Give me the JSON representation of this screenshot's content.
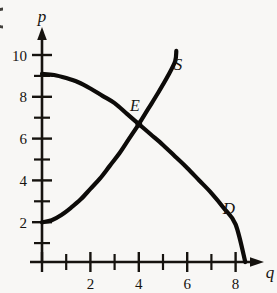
{
  "figure": {
    "background_color": "#f8f7f5",
    "ink_color": "#16130f",
    "edge_marker": "cropped-figure-bullet"
  },
  "axes": {
    "x": {
      "title": "q",
      "title_x": 268,
      "title_y": 272,
      "origin_px": 42,
      "unit_px": 24.2,
      "baseline_y": 262,
      "arrow_tip_x": 263,
      "major_ticks": [
        2,
        4,
        6,
        8
      ],
      "minor_ticks": [
        1,
        3,
        5,
        7
      ],
      "tick_labels": [
        "2",
        "4",
        "6",
        "8"
      ],
      "range": [
        0,
        9.1
      ]
    },
    "y": {
      "title": "p",
      "title_x": 42,
      "title_y": 16,
      "baseline_x": 42,
      "unit_px": 20.9,
      "arrow_tip_y": 30,
      "major_ticks": [
        2,
        4,
        6,
        8,
        10
      ],
      "minor_ticks": [
        1,
        3,
        5,
        7,
        9
      ],
      "tick_labels": [
        "2",
        "4",
        "6",
        "8",
        "10"
      ],
      "range": [
        0,
        11
      ]
    }
  },
  "chart_data": {
    "type": "line",
    "title": "",
    "xlabel": "q",
    "ylabel": "p",
    "xlim": [
      0,
      9.1
    ],
    "ylim": [
      0,
      11
    ],
    "grid": false,
    "legend": "inline-curve-labels",
    "series": [
      {
        "name": "D",
        "label": "D",
        "label_point": {
          "q": 7.7,
          "p": 2.6
        },
        "description": "demand curve, downward sloping, concave",
        "points": [
          {
            "q": 0.0,
            "p": 9.0
          },
          {
            "q": 0.5,
            "p": 8.95
          },
          {
            "q": 1.0,
            "p": 8.8
          },
          {
            "q": 1.5,
            "p": 8.6
          },
          {
            "q": 2.0,
            "p": 8.3
          },
          {
            "q": 2.5,
            "p": 7.95
          },
          {
            "q": 3.0,
            "p": 7.6
          },
          {
            "q": 3.5,
            "p": 7.1
          },
          {
            "q": 4.0,
            "p": 6.6
          },
          {
            "q": 4.5,
            "p": 6.1
          },
          {
            "q": 5.0,
            "p": 5.6
          },
          {
            "q": 5.5,
            "p": 5.05
          },
          {
            "q": 6.0,
            "p": 4.5
          },
          {
            "q": 6.5,
            "p": 3.9
          },
          {
            "q": 7.0,
            "p": 3.3
          },
          {
            "q": 7.5,
            "p": 2.6
          },
          {
            "q": 8.0,
            "p": 1.8
          },
          {
            "q": 8.4,
            "p": 0.0
          }
        ]
      },
      {
        "name": "S",
        "label": "S",
        "label_point": {
          "q": 5.7,
          "p": 9.4
        },
        "description": "supply curve, upward sloping, convex",
        "points": [
          {
            "q": 0.0,
            "p": 1.9
          },
          {
            "q": 0.4,
            "p": 2.0
          },
          {
            "q": 0.8,
            "p": 2.25
          },
          {
            "q": 1.2,
            "p": 2.6
          },
          {
            "q": 1.6,
            "p": 3.0
          },
          {
            "q": 2.0,
            "p": 3.5
          },
          {
            "q": 2.4,
            "p": 4.0
          },
          {
            "q": 2.8,
            "p": 4.6
          },
          {
            "q": 3.2,
            "p": 5.2
          },
          {
            "q": 3.6,
            "p": 5.9
          },
          {
            "q": 4.0,
            "p": 6.6
          },
          {
            "q": 4.4,
            "p": 7.35
          },
          {
            "q": 4.8,
            "p": 8.1
          },
          {
            "q": 5.2,
            "p": 8.9
          },
          {
            "q": 5.5,
            "p": 9.6
          },
          {
            "q": 5.55,
            "p": 10.1
          }
        ]
      }
    ],
    "annotations": [
      {
        "name": "equilibrium-point",
        "label": "E",
        "q": 4.0,
        "p": 6.6,
        "label_offset_px": {
          "x": -5,
          "y": -16
        }
      }
    ]
  }
}
